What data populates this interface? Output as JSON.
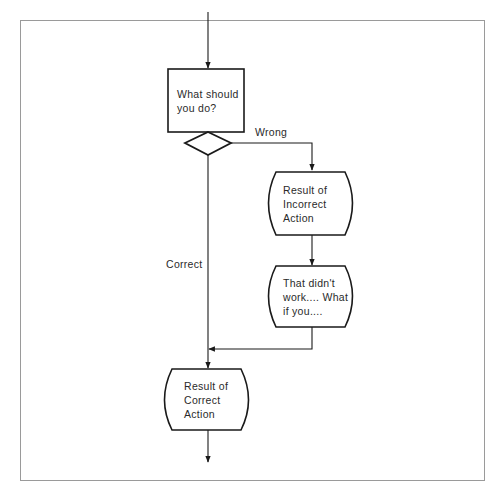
{
  "diagram": {
    "type": "flowchart",
    "frame_color": "#9a9a9a",
    "stroke_color": "#1a1a1a",
    "nodes": [
      {
        "id": "question",
        "shape": "rectangle",
        "text": "What should\nyou do?"
      },
      {
        "id": "decision",
        "shape": "diamond",
        "text": ""
      },
      {
        "id": "incorrect_result",
        "shape": "barrel",
        "text": "Result of\nIncorrect\nAction"
      },
      {
        "id": "retry",
        "shape": "barrel",
        "text": "That didn't\nwork.... What\nif you...."
      },
      {
        "id": "correct_result",
        "shape": "barrel",
        "text": "Result of\nCorrect\nAction"
      }
    ],
    "edges": [
      {
        "from": "start",
        "to": "question",
        "label": ""
      },
      {
        "from": "question",
        "to": "decision",
        "label": ""
      },
      {
        "from": "decision",
        "to": "incorrect_result",
        "label": "Wrong"
      },
      {
        "from": "decision",
        "to": "correct_result",
        "label": "Correct"
      },
      {
        "from": "incorrect_result",
        "to": "retry",
        "label": ""
      },
      {
        "from": "retry",
        "to": "correct_result",
        "label": ""
      },
      {
        "from": "correct_result",
        "to": "end",
        "label": ""
      }
    ],
    "labels": {
      "wrong": "Wrong",
      "correct": "Correct"
    }
  }
}
